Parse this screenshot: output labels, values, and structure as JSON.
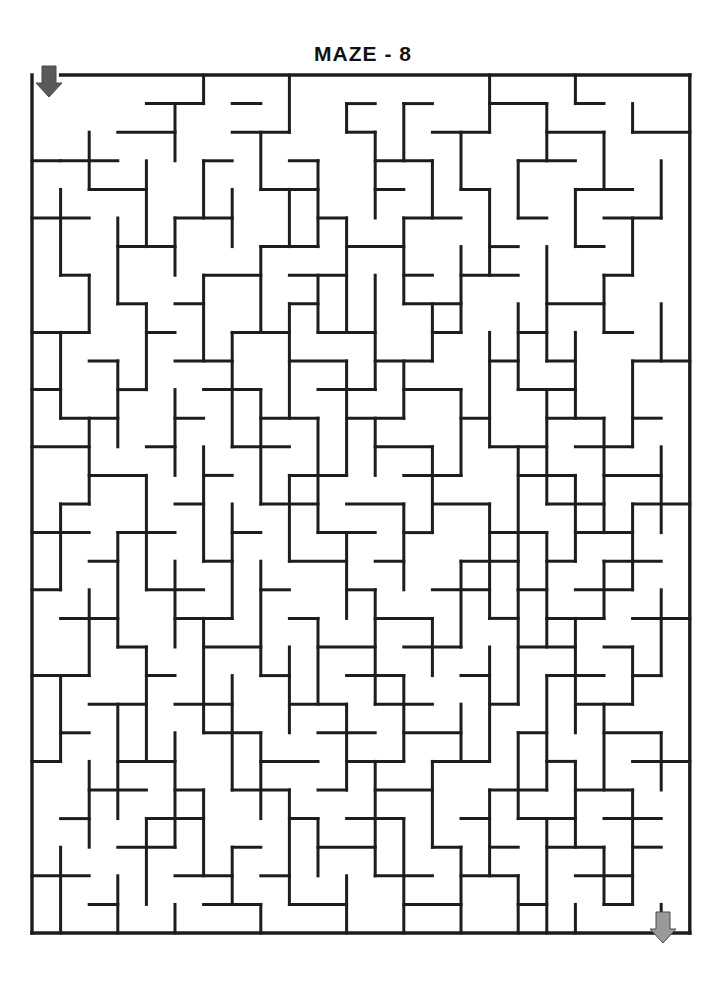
{
  "page": {
    "title": "MAZE - 8",
    "background_color": "#ffffff",
    "wall_color": "#1d1d1d"
  },
  "maze": {
    "label": "maze-8",
    "columns": 23,
    "rows": 30,
    "cell_size": 28.6,
    "origin_x": 32,
    "origin_y": 75,
    "entrance": {
      "label": "entrance-arrow",
      "direction": "down",
      "color": "#595959",
      "x": 49,
      "y": 66,
      "column": 0,
      "row": 0
    },
    "exit": {
      "label": "exit-arrow",
      "direction": "down",
      "color": "#9a9a9a",
      "x": 663,
      "y": 912,
      "column": 22,
      "row": 29
    },
    "border": [
      [
        0,
        0,
        0,
        30
      ],
      [
        23,
        0,
        23,
        30
      ],
      [
        1,
        0,
        23,
        0
      ],
      [
        0,
        30,
        23,
        30
      ]
    ],
    "h_walls": [
      [
        4,
        1,
        6
      ],
      [
        7,
        1,
        8
      ],
      [
        11,
        1,
        12
      ],
      [
        13,
        1,
        14
      ],
      [
        16,
        1,
        18
      ],
      [
        19,
        1,
        20
      ],
      [
        3,
        2,
        5
      ],
      [
        7,
        2,
        9
      ],
      [
        11,
        2,
        12
      ],
      [
        14,
        2,
        16
      ],
      [
        18,
        2,
        20
      ],
      [
        21,
        2,
        23
      ],
      [
        0,
        3,
        1
      ],
      [
        1,
        3,
        3
      ],
      [
        6,
        3,
        7
      ],
      [
        9,
        3,
        10
      ],
      [
        12,
        3,
        14
      ],
      [
        17,
        3,
        19
      ],
      [
        2,
        4,
        4
      ],
      [
        8,
        4,
        10
      ],
      [
        12,
        4,
        13
      ],
      [
        15,
        4,
        16
      ],
      [
        19,
        4,
        21
      ],
      [
        0,
        5,
        2
      ],
      [
        5,
        5,
        7
      ],
      [
        10,
        5,
        11
      ],
      [
        13,
        5,
        15
      ],
      [
        17,
        5,
        18
      ],
      [
        20,
        5,
        22
      ],
      [
        3,
        6,
        5
      ],
      [
        8,
        6,
        10
      ],
      [
        11,
        6,
        13
      ],
      [
        16,
        6,
        17
      ],
      [
        19,
        6,
        20
      ],
      [
        1,
        7,
        2
      ],
      [
        6,
        7,
        8
      ],
      [
        9,
        7,
        11
      ],
      [
        13,
        7,
        14
      ],
      [
        15,
        7,
        17
      ],
      [
        20,
        7,
        21
      ],
      [
        3,
        8,
        4
      ],
      [
        5,
        8,
        6
      ],
      [
        9,
        8,
        10
      ],
      [
        13,
        8,
        15
      ],
      [
        18,
        8,
        20
      ],
      [
        0,
        9,
        2
      ],
      [
        4,
        9,
        5
      ],
      [
        7,
        9,
        9
      ],
      [
        10,
        9,
        12
      ],
      [
        14,
        9,
        15
      ],
      [
        17,
        9,
        18
      ],
      [
        20,
        9,
        21
      ],
      [
        2,
        10,
        3
      ],
      [
        5,
        10,
        7
      ],
      [
        9,
        10,
        11
      ],
      [
        12,
        10,
        14
      ],
      [
        16,
        10,
        17
      ],
      [
        18,
        10,
        19
      ],
      [
        21,
        10,
        23
      ],
      [
        0,
        11,
        1
      ],
      [
        3,
        11,
        4
      ],
      [
        6,
        11,
        8
      ],
      [
        10,
        11,
        12
      ],
      [
        13,
        11,
        15
      ],
      [
        17,
        11,
        19
      ],
      [
        1,
        12,
        3
      ],
      [
        5,
        12,
        6
      ],
      [
        8,
        12,
        10
      ],
      [
        11,
        12,
        13
      ],
      [
        15,
        12,
        16
      ],
      [
        18,
        12,
        20
      ],
      [
        21,
        12,
        22
      ],
      [
        0,
        13,
        2
      ],
      [
        4,
        13,
        5
      ],
      [
        7,
        13,
        9
      ],
      [
        12,
        13,
        14
      ],
      [
        16,
        13,
        18
      ],
      [
        19,
        13,
        21
      ],
      [
        2,
        14,
        4
      ],
      [
        6,
        14,
        7
      ],
      [
        9,
        14,
        11
      ],
      [
        13,
        14,
        15
      ],
      [
        17,
        14,
        19
      ],
      [
        20,
        14,
        22
      ],
      [
        1,
        15,
        2
      ],
      [
        5,
        15,
        6
      ],
      [
        8,
        15,
        10
      ],
      [
        11,
        15,
        13
      ],
      [
        14,
        15,
        16
      ],
      [
        18,
        15,
        20
      ],
      [
        21,
        15,
        23
      ],
      [
        0,
        16,
        2
      ],
      [
        3,
        16,
        5
      ],
      [
        7,
        16,
        8
      ],
      [
        10,
        16,
        12
      ],
      [
        13,
        16,
        14
      ],
      [
        16,
        16,
        18
      ],
      [
        19,
        16,
        21
      ],
      [
        2,
        17,
        3
      ],
      [
        6,
        17,
        7
      ],
      [
        9,
        17,
        11
      ],
      [
        12,
        17,
        13
      ],
      [
        15,
        17,
        17
      ],
      [
        18,
        17,
        19
      ],
      [
        20,
        17,
        22
      ],
      [
        0,
        18,
        1
      ],
      [
        4,
        18,
        6
      ],
      [
        8,
        18,
        9
      ],
      [
        11,
        18,
        12
      ],
      [
        14,
        18,
        16
      ],
      [
        17,
        18,
        18
      ],
      [
        19,
        18,
        21
      ],
      [
        1,
        19,
        3
      ],
      [
        5,
        19,
        7
      ],
      [
        9,
        19,
        10
      ],
      [
        12,
        19,
        14
      ],
      [
        16,
        19,
        17
      ],
      [
        18,
        19,
        20
      ],
      [
        21,
        19,
        23
      ],
      [
        3,
        20,
        4
      ],
      [
        6,
        20,
        8
      ],
      [
        10,
        20,
        12
      ],
      [
        13,
        20,
        15
      ],
      [
        17,
        20,
        19
      ],
      [
        20,
        20,
        21
      ],
      [
        0,
        21,
        2
      ],
      [
        4,
        21,
        5
      ],
      [
        8,
        21,
        9
      ],
      [
        11,
        21,
        13
      ],
      [
        15,
        21,
        16
      ],
      [
        18,
        21,
        20
      ],
      [
        21,
        21,
        22
      ],
      [
        2,
        22,
        4
      ],
      [
        5,
        22,
        7
      ],
      [
        9,
        22,
        11
      ],
      [
        12,
        22,
        14
      ],
      [
        16,
        22,
        17
      ],
      [
        19,
        22,
        21
      ],
      [
        1,
        23,
        2
      ],
      [
        6,
        23,
        8
      ],
      [
        10,
        23,
        12
      ],
      [
        13,
        23,
        15
      ],
      [
        17,
        23,
        18
      ],
      [
        20,
        23,
        22
      ],
      [
        0,
        24,
        1
      ],
      [
        3,
        24,
        5
      ],
      [
        8,
        24,
        10
      ],
      [
        11,
        24,
        13
      ],
      [
        14,
        24,
        16
      ],
      [
        18,
        24,
        19
      ],
      [
        21,
        24,
        23
      ],
      [
        2,
        25,
        4
      ],
      [
        5,
        25,
        6
      ],
      [
        7,
        25,
        9
      ],
      [
        10,
        25,
        11
      ],
      [
        12,
        25,
        14
      ],
      [
        16,
        25,
        18
      ],
      [
        19,
        25,
        21
      ],
      [
        1,
        26,
        2
      ],
      [
        4,
        26,
        6
      ],
      [
        9,
        26,
        10
      ],
      [
        11,
        26,
        13
      ],
      [
        15,
        26,
        16
      ],
      [
        17,
        26,
        19
      ],
      [
        20,
        26,
        22
      ],
      [
        3,
        27,
        5
      ],
      [
        7,
        27,
        8
      ],
      [
        10,
        27,
        12
      ],
      [
        14,
        27,
        15
      ],
      [
        16,
        27,
        17
      ],
      [
        18,
        27,
        20
      ],
      [
        21,
        27,
        22
      ],
      [
        0,
        28,
        2
      ],
      [
        5,
        28,
        7
      ],
      [
        8,
        28,
        9
      ],
      [
        12,
        28,
        14
      ],
      [
        15,
        28,
        17
      ],
      [
        19,
        28,
        21
      ],
      [
        2,
        29,
        3
      ],
      [
        6,
        29,
        8
      ],
      [
        9,
        29,
        11
      ],
      [
        13,
        29,
        15
      ],
      [
        17,
        29,
        18
      ],
      [
        20,
        29,
        21
      ]
    ],
    "v_walls": [
      [
        6,
        0,
        1
      ],
      [
        9,
        0,
        2
      ],
      [
        16,
        0,
        2
      ],
      [
        19,
        0,
        1
      ],
      [
        5,
        1,
        3
      ],
      [
        11,
        1,
        2
      ],
      [
        13,
        1,
        3
      ],
      [
        18,
        1,
        3
      ],
      [
        21,
        1,
        2
      ],
      [
        2,
        2,
        4
      ],
      [
        8,
        2,
        4
      ],
      [
        12,
        2,
        5
      ],
      [
        15,
        2,
        4
      ],
      [
        20,
        2,
        4
      ],
      [
        4,
        3,
        6
      ],
      [
        6,
        3,
        5
      ],
      [
        10,
        3,
        6
      ],
      [
        14,
        3,
        5
      ],
      [
        17,
        3,
        5
      ],
      [
        22,
        3,
        5
      ],
      [
        1,
        4,
        7
      ],
      [
        7,
        4,
        6
      ],
      [
        9,
        4,
        6
      ],
      [
        16,
        4,
        7
      ],
      [
        19,
        4,
        6
      ],
      [
        3,
        5,
        8
      ],
      [
        5,
        5,
        7
      ],
      [
        11,
        5,
        9
      ],
      [
        13,
        5,
        8
      ],
      [
        21,
        5,
        7
      ],
      [
        8,
        6,
        9
      ],
      [
        15,
        6,
        9
      ],
      [
        18,
        6,
        10
      ],
      [
        2,
        7,
        9
      ],
      [
        6,
        7,
        10
      ],
      [
        10,
        7,
        9
      ],
      [
        12,
        7,
        11
      ],
      [
        20,
        7,
        9
      ],
      [
        4,
        8,
        11
      ],
      [
        9,
        8,
        12
      ],
      [
        14,
        8,
        10
      ],
      [
        17,
        8,
        11
      ],
      [
        22,
        8,
        10
      ],
      [
        1,
        9,
        12
      ],
      [
        7,
        9,
        13
      ],
      [
        16,
        9,
        13
      ],
      [
        19,
        9,
        12
      ],
      [
        3,
        10,
        13
      ],
      [
        11,
        10,
        14
      ],
      [
        13,
        10,
        12
      ],
      [
        21,
        10,
        13
      ],
      [
        5,
        11,
        14
      ],
      [
        8,
        11,
        15
      ],
      [
        15,
        11,
        14
      ],
      [
        18,
        11,
        15
      ],
      [
        2,
        12,
        15
      ],
      [
        10,
        12,
        16
      ],
      [
        12,
        12,
        14
      ],
      [
        20,
        12,
        16
      ],
      [
        6,
        13,
        17
      ],
      [
        14,
        13,
        16
      ],
      [
        17,
        13,
        18
      ],
      [
        22,
        13,
        16
      ],
      [
        4,
        14,
        18
      ],
      [
        9,
        14,
        17
      ],
      [
        19,
        14,
        17
      ],
      [
        1,
        15,
        18
      ],
      [
        7,
        15,
        19
      ],
      [
        13,
        15,
        18
      ],
      [
        16,
        15,
        19
      ],
      [
        21,
        15,
        18
      ],
      [
        3,
        16,
        20
      ],
      [
        11,
        16,
        19
      ],
      [
        18,
        16,
        20
      ],
      [
        5,
        17,
        20
      ],
      [
        8,
        17,
        21
      ],
      [
        15,
        17,
        20
      ],
      [
        20,
        17,
        19
      ],
      [
        2,
        18,
        21
      ],
      [
        12,
        18,
        22
      ],
      [
        17,
        18,
        22
      ],
      [
        22,
        18,
        21
      ],
      [
        6,
        19,
        23
      ],
      [
        10,
        19,
        22
      ],
      [
        14,
        19,
        21
      ],
      [
        19,
        19,
        23
      ],
      [
        4,
        20,
        24
      ],
      [
        9,
        20,
        23
      ],
      [
        16,
        20,
        24
      ],
      [
        21,
        20,
        22
      ],
      [
        1,
        21,
        24
      ],
      [
        7,
        21,
        25
      ],
      [
        13,
        21,
        24
      ],
      [
        18,
        21,
        25
      ],
      [
        3,
        22,
        26
      ],
      [
        11,
        22,
        25
      ],
      [
        15,
        22,
        24
      ],
      [
        20,
        22,
        25
      ],
      [
        5,
        23,
        27
      ],
      [
        8,
        23,
        26
      ],
      [
        17,
        23,
        26
      ],
      [
        22,
        23,
        25
      ],
      [
        2,
        24,
        27
      ],
      [
        12,
        24,
        28
      ],
      [
        14,
        24,
        27
      ],
      [
        19,
        24,
        27
      ],
      [
        6,
        25,
        28
      ],
      [
        9,
        25,
        29
      ],
      [
        16,
        25,
        28
      ],
      [
        21,
        25,
        29
      ],
      [
        4,
        26,
        29
      ],
      [
        10,
        26,
        28
      ],
      [
        13,
        26,
        30
      ],
      [
        18,
        26,
        30
      ],
      [
        1,
        27,
        30
      ],
      [
        7,
        27,
        29
      ],
      [
        15,
        27,
        30
      ],
      [
        20,
        27,
        29
      ],
      [
        3,
        28,
        30
      ],
      [
        11,
        28,
        30
      ],
      [
        17,
        28,
        30
      ],
      [
        8,
        29,
        30
      ],
      [
        22,
        29,
        30
      ],
      [
        5,
        29,
        30
      ],
      [
        19,
        29,
        30
      ]
    ]
  }
}
